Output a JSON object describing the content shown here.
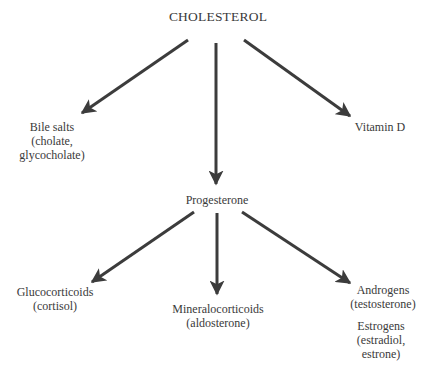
{
  "diagram": {
    "root": {
      "label": "CHOLESTEROL"
    },
    "level1": [
      {
        "id": "bile",
        "lines": [
          "Bile salts",
          "(cholate,",
          "glycocholate)"
        ]
      },
      {
        "id": "progesterone",
        "lines": [
          "Progesterone"
        ]
      },
      {
        "id": "vitd",
        "lines": [
          "Vitamin D"
        ]
      }
    ],
    "level2": [
      {
        "id": "gluco",
        "lines": [
          "Glucocorticoids",
          "(cortisol)"
        ]
      },
      {
        "id": "mineralo",
        "lines": [
          "Mineralocorticoids",
          "(aldosterone)"
        ]
      },
      {
        "id": "androgens",
        "lines": [
          "Androgens",
          "(testosterone)"
        ]
      },
      {
        "id": "estrogens",
        "lines": [
          "Estrogens",
          "(estradiol,",
          "estrone)"
        ]
      }
    ],
    "edges": [
      {
        "from": "CHOLESTEROL",
        "to": "Bile salts"
      },
      {
        "from": "CHOLESTEROL",
        "to": "Progesterone"
      },
      {
        "from": "CHOLESTEROL",
        "to": "Vitamin D"
      },
      {
        "from": "Progesterone",
        "to": "Glucocorticoids"
      },
      {
        "from": "Progesterone",
        "to": "Mineralocorticoids"
      },
      {
        "from": "Progesterone",
        "to": "Androgens"
      }
    ],
    "colors": {
      "arrow": "#3c3c3c",
      "text": "#3a3a3a"
    }
  }
}
